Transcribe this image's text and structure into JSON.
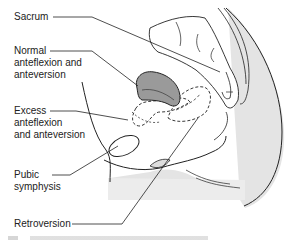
{
  "diagram": {
    "labels": [
      {
        "id": "sacrum",
        "text": "Sacrum"
      },
      {
        "id": "normal",
        "text": "Normal\nanteflexion and\nanteversion"
      },
      {
        "id": "excess",
        "text": "Excess\nanteflexion\nand anteversion"
      },
      {
        "id": "pubic",
        "text": "Pubic\nsymphysis"
      },
      {
        "id": "retroversion",
        "text": "Retroversion"
      }
    ],
    "colors": {
      "line": "#222222",
      "uterus_fill": "#9a9a9a",
      "body_shade": "#e4e4e4"
    }
  }
}
